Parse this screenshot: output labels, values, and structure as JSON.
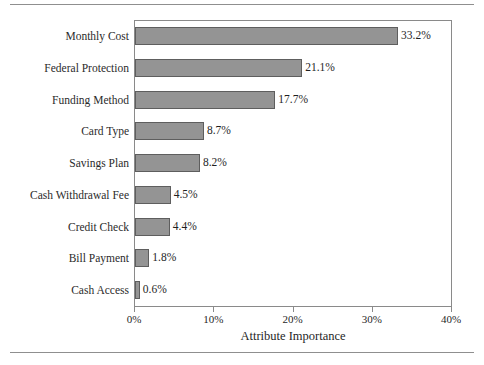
{
  "chart_data": {
    "type": "bar",
    "orientation": "horizontal",
    "title": "",
    "xlabel": "Attribute Importance",
    "ylabel": "",
    "categories": [
      "Monthly Cost",
      "Federal Protection",
      "Funding Method",
      "Card Type",
      "Savings Plan",
      "Cash Withdrawal Fee",
      "Credit Check",
      "Bill Payment",
      "Cash Access"
    ],
    "values": [
      33.2,
      21.1,
      17.7,
      8.7,
      8.2,
      4.5,
      4.4,
      1.8,
      0.6
    ],
    "data_labels": [
      "33.2%",
      "21.1%",
      "17.7%",
      "8.7%",
      "8.2%",
      "4.5%",
      "4.4%",
      "1.8%",
      "0.6%"
    ],
    "xlim": [
      0,
      40
    ],
    "xticks": [
      0,
      10,
      20,
      30,
      40
    ],
    "xtick_labels": [
      "0%",
      "10%",
      "20%",
      "30%",
      "40%"
    ],
    "grid": false,
    "legend": false,
    "bar_color": "#949494",
    "bar_edge_color": "#5e5e5e",
    "frame_color": "#8a8a8a",
    "text_color": "#1f1f1f",
    "rule_color": "#8f8f8f"
  }
}
